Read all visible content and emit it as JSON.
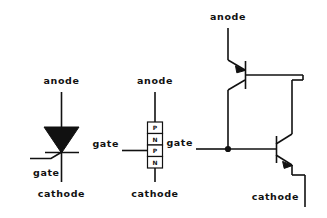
{
  "figure": {
    "ink_color": "#111111",
    "background_color": "#ffffff",
    "width": 327,
    "height": 218
  },
  "diagrams": [
    {
      "id": "scr-symbol",
      "name": "scr-schematic-symbol",
      "labels": {
        "anode": "anode",
        "gate": "gate",
        "cathode": "cathode"
      }
    },
    {
      "id": "pnpn-structure",
      "name": "pnpn-four-layer-structure",
      "labels": {
        "anode": "anode",
        "gate": "gate",
        "cathode": "cathode"
      },
      "layers": [
        "P",
        "N",
        "P",
        "N"
      ]
    },
    {
      "id": "two-transistor-equivalent",
      "name": "two-transistor-equivalent-circuit",
      "labels": {
        "anode": "anode",
        "gate": "gate",
        "cathode": "cathode"
      },
      "transistors": [
        {
          "name": "pnp-transistor",
          "type": "PNP"
        },
        {
          "name": "npn-transistor",
          "type": "NPN"
        }
      ]
    }
  ]
}
